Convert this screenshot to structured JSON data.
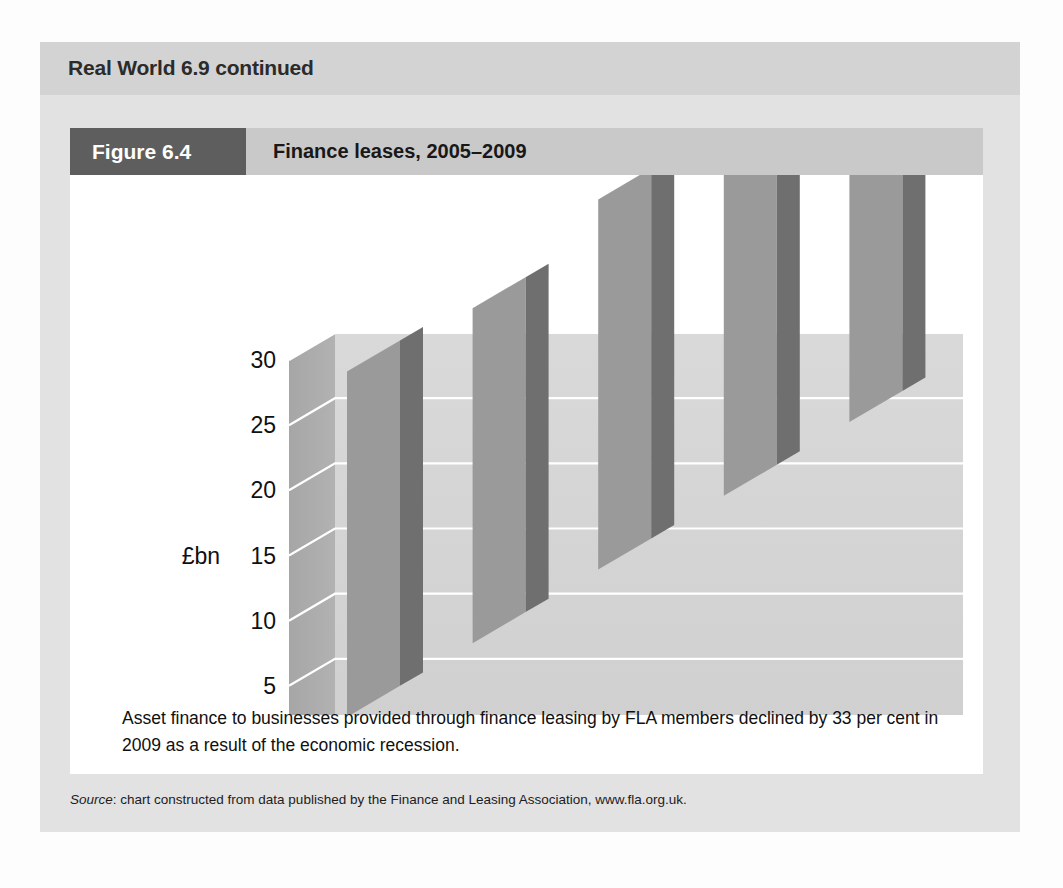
{
  "box": {
    "header_label": "Real World 6.9 continued"
  },
  "figure": {
    "tag": "Figure 6.4",
    "title": "Finance leases, 2005–2009",
    "caption": "Asset finance to businesses provided through finance leasing by FLA members declined by 33 per cent in 2009 as a result of the economic recession.",
    "source_prefix": "Source",
    "source_text": ": chart constructed from data published by the Finance and Leasing Association, www.fla.org.uk."
  },
  "colors": {
    "outer_panel": "#e2e2e2",
    "box_header": "#d3d3d3",
    "figure_tag": "#5e5e5e",
    "figure_header": "#c9c9c9",
    "card": "#ffffff",
    "bar_front": "#9a9a9a",
    "bar_side": "#6f6f6f",
    "bar_top": "#b5b5b5",
    "wall_back": "#d5d5d5",
    "wall_left": "#a9a9a9",
    "floor": "#c2c2c2",
    "gridline": "#ffffff",
    "text": "#101010"
  },
  "chart_data": {
    "type": "bar",
    "title": "Finance leases, 2005–2009",
    "xlabel": "",
    "ylabel": "£bn",
    "categories": [
      "2005",
      "2006",
      "2007",
      "2008",
      "2009"
    ],
    "values": [
      26.5,
      25.7,
      28.4,
      28.8,
      19.3
    ],
    "yticks": [
      0,
      5,
      10,
      15,
      20,
      25,
      30
    ],
    "ytick_labels": [
      "0",
      "5",
      "10",
      "15",
      "20",
      "25",
      "30"
    ],
    "ylim": [
      0,
      30
    ],
    "grid": true,
    "legend": "none",
    "style": "3d-column"
  }
}
